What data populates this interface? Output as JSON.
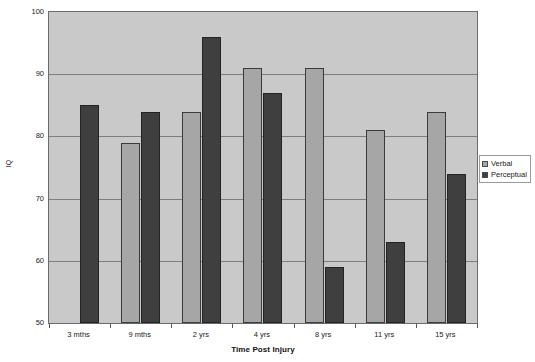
{
  "chart_data": {
    "type": "bar",
    "title": "",
    "subtitle": "",
    "xlabel": "Time Post Injury",
    "ylabel": "IQ",
    "categories": [
      "3 mths",
      "9 mths",
      "2 yrs",
      "4 yrs",
      "8 yrs",
      "11 yrs",
      "15 yrs"
    ],
    "series": [
      {
        "name": "Verbal",
        "color": "#a6a6a6",
        "values": [
          null,
          79,
          84,
          91,
          91,
          81,
          84
        ]
      },
      {
        "name": "Perceptual",
        "color": "#3f3f3f",
        "values": [
          85,
          84,
          96,
          87,
          59,
          63,
          74
        ]
      }
    ],
    "ylim": [
      50,
      100
    ],
    "y_ticks": [
      50,
      60,
      70,
      80,
      90,
      100
    ],
    "grid": "horizontal",
    "legend_position": "right",
    "plot_background": "#c9c9c9"
  },
  "legend": {
    "items": [
      {
        "label": "Verbal"
      },
      {
        "label": "Perceptual"
      }
    ]
  },
  "axes": {
    "y_title": "IQ",
    "x_title": "Time Post Injury"
  }
}
